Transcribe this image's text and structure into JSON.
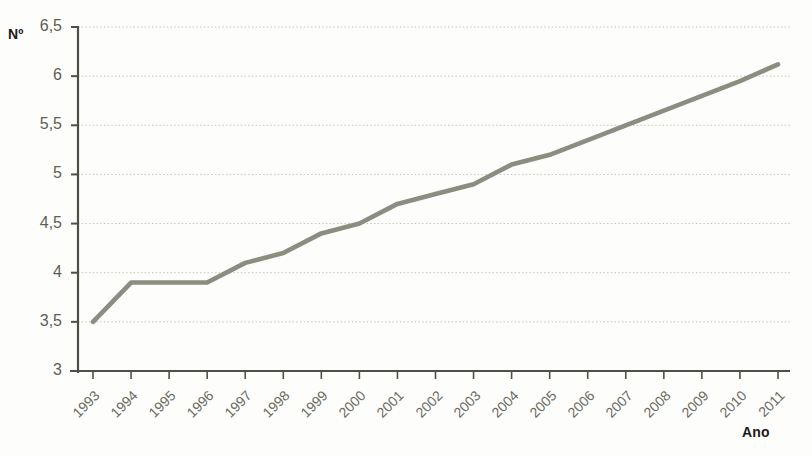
{
  "chart_data": {
    "type": "line",
    "title": "",
    "subtitle": "",
    "xlabel": "Ano",
    "ylabel": "Nº",
    "x": [
      1993,
      1994,
      1995,
      1996,
      1997,
      1998,
      1999,
      2000,
      2001,
      2002,
      2003,
      2004,
      2005,
      2006,
      2007,
      2008,
      2009,
      2010,
      2011
    ],
    "categories": [
      "1993",
      "1994",
      "1995",
      "1996",
      "1997",
      "1998",
      "1999",
      "2000",
      "2001",
      "2002",
      "2003",
      "2004",
      "2005",
      "2006",
      "2007",
      "2008",
      "2009",
      "2010",
      "2011"
    ],
    "values": [
      3.5,
      3.9,
      3.9,
      3.9,
      4.1,
      4.2,
      4.4,
      4.5,
      4.7,
      4.8,
      4.9,
      5.1,
      5.2,
      5.35,
      5.5,
      5.65,
      5.8,
      5.95,
      6.12
    ],
    "series": [
      {
        "name": "Nº",
        "values": [
          3.5,
          3.9,
          3.9,
          3.9,
          4.1,
          4.2,
          4.4,
          4.5,
          4.7,
          4.8,
          4.9,
          5.1,
          5.2,
          5.35,
          5.5,
          5.65,
          5.8,
          5.95,
          6.12
        ],
        "color": "#8c8c80"
      }
    ],
    "ylim": [
      3,
      6.5
    ],
    "xlim": [
      1993,
      2011
    ],
    "ytick_values": [
      3,
      3.5,
      4,
      4.5,
      5,
      5.5,
      6,
      6.5
    ],
    "ytick_labels": [
      "3",
      "3,5",
      "4",
      "4,5",
      "5",
      "5,5",
      "6",
      "6,5"
    ],
    "grid": true,
    "grid_axis": "y",
    "grid_style": "dotted",
    "legend": false,
    "legend_position": "none",
    "markers": false,
    "decimal_separator": ","
  },
  "style": {
    "line_color": "#8c8c80",
    "axis_color": "#4f4f4a",
    "grid_color": "#c9c6b4",
    "tick_label_color": "#6a6a60",
    "title_color": "#1a1a1a",
    "background": "#fdfdfb"
  }
}
